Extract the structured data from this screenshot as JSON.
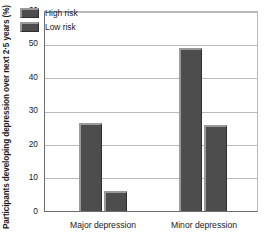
{
  "chart_data": {
    "type": "bar",
    "title": "",
    "subtitle": "",
    "xlabel": "",
    "ylabel": "Participants developing depression over next 2·5 years (%)",
    "categories": [
      "Major depression",
      "Minor depression"
    ],
    "series": [
      {
        "name": "High risk",
        "values": [
          26.5,
          49.0
        ],
        "color": "#4d4d4d"
      },
      {
        "name": "Low risk",
        "values": [
          6.0,
          26.0
        ],
        "color": "#4d4d4d"
      }
    ],
    "ylim": [
      0,
      60
    ],
    "yticks": [
      0,
      10,
      20,
      30,
      40,
      50,
      60
    ],
    "ytick_labels": [
      "0",
      "10",
      "20",
      "30",
      "40",
      "50",
      "60"
    ],
    "grid": true,
    "grid_axis": "y",
    "legend_position": "top-left",
    "legend_entries": [
      "High risk",
      "Low risk"
    ],
    "annotations": []
  },
  "axis": {
    "y_title": "Participants developing depression over next 2·5 years (%)",
    "tick_labels": [
      "60",
      "50",
      "40",
      "30",
      "20",
      "10",
      "0"
    ]
  },
  "legend": {
    "items": [
      {
        "label": "High risk"
      },
      {
        "label": "Low risk"
      }
    ]
  },
  "xaxis": {
    "categories": [
      {
        "label": "Major depression"
      },
      {
        "label": "Minor depression"
      }
    ]
  }
}
